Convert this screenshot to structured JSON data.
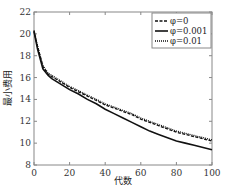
{
  "chart_data": {
    "type": "line",
    "title": "",
    "xlabel": "代数",
    "ylabel": "最小费用",
    "xlim": [
      0,
      100
    ],
    "ylim": [
      8,
      22
    ],
    "x_ticks": [
      0,
      20,
      40,
      60,
      80,
      100
    ],
    "y_ticks": [
      8,
      10,
      12,
      14,
      16,
      18,
      20,
      22
    ],
    "grid": false,
    "legend_position": "upper right",
    "x": [
      0,
      2,
      5,
      8,
      10,
      15,
      20,
      25,
      30,
      35,
      40,
      45,
      50,
      55,
      60,
      65,
      70,
      75,
      80,
      85,
      90,
      95,
      100
    ],
    "series": [
      {
        "name": "φ=0",
        "style": "dashed",
        "values": [
          20.3,
          18.8,
          17.0,
          16.3,
          16.1,
          15.6,
          15.1,
          14.7,
          14.3,
          13.9,
          13.5,
          13.2,
          12.9,
          12.6,
          12.2,
          11.9,
          11.6,
          11.3,
          11.0,
          10.8,
          10.6,
          10.4,
          10.2
        ]
      },
      {
        "name": "φ=0.001",
        "style": "solid",
        "values": [
          20.2,
          18.6,
          16.8,
          16.2,
          15.9,
          15.4,
          14.9,
          14.5,
          14.0,
          13.6,
          13.1,
          12.7,
          12.3,
          11.9,
          11.5,
          11.1,
          10.8,
          10.5,
          10.2,
          10.0,
          9.8,
          9.6,
          9.4
        ]
      },
      {
        "name": "φ=0.01",
        "style": "dotted",
        "values": [
          20.3,
          18.9,
          17.1,
          16.4,
          16.2,
          15.7,
          15.2,
          14.8,
          14.4,
          14.0,
          13.6,
          13.3,
          13.0,
          12.7,
          12.3,
          12.0,
          11.7,
          11.4,
          11.1,
          10.9,
          10.7,
          10.5,
          10.3
        ]
      }
    ]
  },
  "legend": {
    "items": [
      {
        "label": "φ=0",
        "style": "dashed"
      },
      {
        "label": "φ=0.001",
        "style": "solid"
      },
      {
        "label": "φ=0.01",
        "style": "dotted"
      }
    ]
  },
  "axes": {
    "xlabel": "代数",
    "ylabel": "最小费用",
    "x_tick_labels": [
      "0",
      "20",
      "40",
      "60",
      "80",
      "100"
    ],
    "y_tick_labels": [
      "8",
      "10",
      "12",
      "14",
      "16",
      "18",
      "20",
      "22"
    ]
  },
  "colors": {
    "axis": "#888888",
    "line": "#111111",
    "background": "#ffffff"
  }
}
